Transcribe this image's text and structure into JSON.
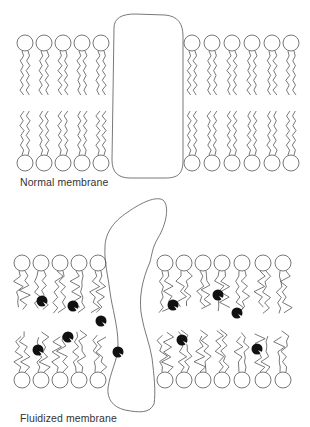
{
  "panels": [
    {
      "id": "normal",
      "label": "Normal membrane",
      "head_y_top": 43,
      "head_y_bottom": 163,
      "head_r": 8,
      "heads_left_x": [
        25,
        44,
        63,
        82,
        101
      ],
      "heads_right_x": [
        192,
        212,
        232,
        252,
        272,
        291
      ],
      "protein": "rounded rectangular transmembrane protein spanning bilayer"
    },
    {
      "id": "fluidized",
      "label": "Fluidized membrane",
      "head_y_top": 263,
      "head_y_bottom": 380,
      "head_r": 8,
      "heads_left_x": [
        22,
        41,
        60,
        79,
        98
      ],
      "heads_right_x": [
        165,
        184,
        203,
        222,
        242,
        263,
        283
      ],
      "protein": "irregular distorted transmembrane protein",
      "dots": [
        [
          42,
          301
        ],
        [
          73,
          306
        ],
        [
          101,
          321
        ],
        [
          68,
          337
        ],
        [
          38,
          350
        ],
        [
          118,
          352
        ],
        [
          173,
          305
        ],
        [
          218,
          295
        ],
        [
          237,
          313
        ],
        [
          182,
          340
        ],
        [
          257,
          349
        ]
      ]
    }
  ],
  "colors": {
    "line": "#555555",
    "dot": "#111111",
    "background": "#ffffff"
  }
}
